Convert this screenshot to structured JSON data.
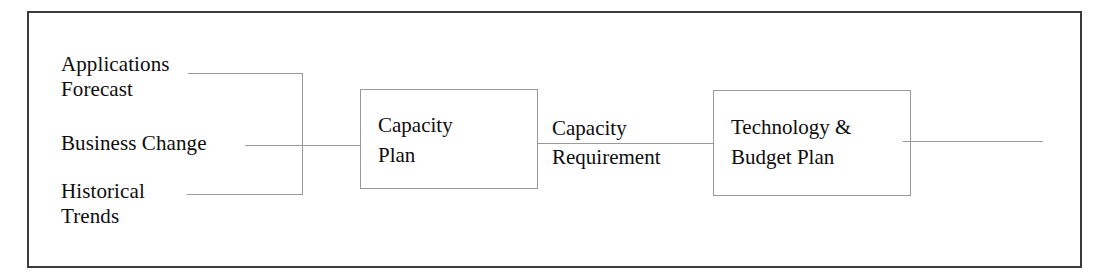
{
  "diagram": {
    "frame_color": "#3b3b3b",
    "line_color": "#9a9a9a",
    "text_color": "#0d0d0d",
    "inputs": [
      {
        "id": "applications-forecast",
        "label": "Applications\nForecast"
      },
      {
        "id": "business-change",
        "label": "Business Change"
      },
      {
        "id": "historical-trends",
        "label": "Historical\nTrends"
      }
    ],
    "processes": [
      {
        "id": "capacity-plan",
        "label": "Capacity\nPlan"
      },
      {
        "id": "tech-budget-plan",
        "label": "Technology &\nBudget Plan"
      }
    ],
    "connectors": [
      {
        "id": "capacity-requirement",
        "label": "Capacity\nRequirement"
      }
    ]
  }
}
